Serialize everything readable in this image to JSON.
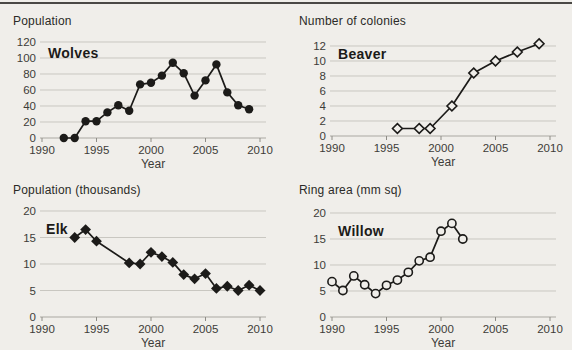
{
  "style": {
    "background": "#f0eeea",
    "top_rule_color": "#4a4845",
    "gridline_color": "#c9c7c1",
    "axis_line_color": "#aaa8a2",
    "tick_mark_color": "#8e8c86",
    "tick_label_color": "#3d3c38",
    "series_color": "#1c1b19",
    "title_color": "#1c1b19"
  },
  "chart_data": [
    {
      "id": "wolves",
      "type": "line",
      "title": "Wolves",
      "ylabel": "Population",
      "xlabel": "Year",
      "marker": "filled-circle",
      "grid": "horizontal",
      "legend": "none",
      "xlim": [
        1990,
        2010
      ],
      "ylim": [
        0,
        120
      ],
      "yticks": [
        0,
        20,
        40,
        60,
        80,
        100,
        120
      ],
      "xticks": [
        1990,
        1995,
        2000,
        2005,
        2010
      ],
      "x": [
        1992,
        1993,
        1994,
        1995,
        1996,
        1997,
        1998,
        1999,
        2000,
        2001,
        2002,
        2003,
        2004,
        2005,
        2006,
        2007,
        2008,
        2009
      ],
      "y": [
        0,
        0,
        21,
        21,
        32,
        41,
        34,
        67,
        69,
        78,
        94,
        81,
        53,
        72,
        92,
        57,
        41,
        36
      ]
    },
    {
      "id": "beaver",
      "type": "line",
      "title": "Beaver",
      "ylabel": "Number of colonies",
      "xlabel": "Year",
      "marker": "open-diamond",
      "grid": "horizontal",
      "legend": "none",
      "xlim": [
        1990,
        2010
      ],
      "ylim": [
        0,
        12
      ],
      "yticks": [
        0,
        2,
        4,
        6,
        8,
        10,
        12
      ],
      "xticks": [
        1990,
        1995,
        2000,
        2005,
        2010
      ],
      "x": [
        1996,
        1998,
        1999,
        2001,
        2003,
        2005,
        2007,
        2009
      ],
      "y": [
        1,
        1,
        1,
        4,
        8.4,
        10,
        11.2,
        12.3
      ]
    },
    {
      "id": "elk",
      "type": "line",
      "title": "Elk",
      "ylabel": "Population (thousands)",
      "xlabel": "Year",
      "marker": "filled-diamond",
      "grid": "horizontal",
      "legend": "none",
      "xlim": [
        1990,
        2010
      ],
      "ylim": [
        0,
        20
      ],
      "yticks": [
        0,
        5,
        10,
        15,
        20
      ],
      "xticks": [
        1990,
        1995,
        2000,
        2005,
        2010
      ],
      "x": [
        1993,
        1994,
        1995,
        1998,
        1999,
        2000,
        2001,
        2002,
        2003,
        2004,
        2005,
        2006,
        2007,
        2008,
        2009,
        2010
      ],
      "y": [
        15,
        16.5,
        14.3,
        10.2,
        10,
        12.2,
        11.4,
        10.3,
        8,
        7.2,
        8.2,
        5.4,
        5.8,
        5,
        6,
        5
      ]
    },
    {
      "id": "willow",
      "type": "line",
      "title": "Willow",
      "ylabel": "Ring area (mm sq)",
      "xlabel": "Year",
      "marker": "open-circle",
      "grid": "horizontal",
      "legend": "none",
      "xlim": [
        1990,
        2010
      ],
      "ylim": [
        0,
        20
      ],
      "yticks": [
        0,
        5,
        10,
        15,
        20
      ],
      "xticks": [
        1990,
        1995,
        2000,
        2005,
        2010
      ],
      "x": [
        1990,
        1991,
        1992,
        1993,
        1994,
        1995,
        1996,
        1997,
        1998,
        1999,
        2000,
        2001,
        2002
      ],
      "y": [
        6.8,
        5.1,
        7.9,
        6.2,
        4.5,
        6.1,
        7.1,
        8.6,
        10.8,
        11.5,
        16.5,
        18,
        15
      ]
    }
  ]
}
